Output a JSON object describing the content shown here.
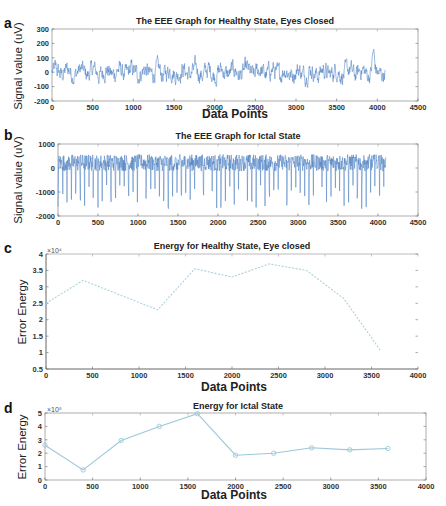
{
  "chart_data": [
    {
      "panel_label": "a",
      "type": "line",
      "title": "The EEE Graph for Healthy State, Eyes Closed",
      "xlabel": "Data Points",
      "ylabel": "Signal value (uV)",
      "xlim": [
        0,
        4500
      ],
      "ylim": [
        -200,
        300
      ],
      "xticks": [
        0,
        500,
        1000,
        1500,
        2000,
        2500,
        3000,
        3500,
        4000,
        4500
      ],
      "yticks": [
        -200,
        -100,
        0,
        100,
        200,
        300
      ],
      "series": [
        {
          "name": "EEG healthy eyes closed",
          "n_points": 4097,
          "approx_range": [
            -160,
            230
          ],
          "notable_peak": {
            "x": 3950,
            "y": 225
          },
          "color": "#4a7fc1"
        }
      ],
      "grid": false
    },
    {
      "panel_label": "b",
      "type": "line",
      "title": "The EEE Graph for Ictal State",
      "xlabel": "Data Points",
      "ylabel": "Signal value (uV)",
      "xlim": [
        0,
        4500
      ],
      "ylim": [
        -2000,
        1000
      ],
      "xticks": [
        0,
        500,
        1000,
        1500,
        2000,
        2500,
        3000,
        3500,
        4000,
        4500
      ],
      "yticks": [
        -2000,
        -1000,
        0,
        1000
      ],
      "series": [
        {
          "name": "EEG ictal",
          "n_points": 4097,
          "approx_range": [
            -1800,
            900
          ],
          "color": "#4a7fc1"
        }
      ],
      "grid": false
    },
    {
      "panel_label": "c",
      "type": "line",
      "title": "Energy for Healthy State, Eye closed",
      "xlabel": "Data Points",
      "ylabel": "Error Energy",
      "y_multiplier": "×10^4",
      "xlim": [
        0,
        4000
      ],
      "ylim": [
        0.5,
        4
      ],
      "xticks": [
        0,
        500,
        1000,
        1500,
        2000,
        2500,
        3000,
        3500,
        4000
      ],
      "yticks": [
        0.5,
        1,
        1.5,
        2,
        2.5,
        3,
        3.5,
        4
      ],
      "series": [
        {
          "name": "Energy healthy",
          "x": [
            0,
            400,
            1200,
            1600,
            2000,
            2400,
            2800,
            3200,
            3600
          ],
          "y": [
            2.5,
            3.2,
            2.3,
            3.55,
            3.3,
            3.7,
            3.5,
            2.65,
            1.05
          ],
          "color": "#a8d4dc"
        }
      ],
      "grid": false
    },
    {
      "panel_label": "d",
      "type": "line",
      "title": "Energy for Ictal State",
      "xlabel": "Data Points",
      "ylabel": "Error Energy",
      "y_multiplier": "×10^8",
      "xlim": [
        0,
        4000
      ],
      "ylim": [
        0,
        5
      ],
      "xticks": [
        0,
        500,
        1000,
        1500,
        2000,
        2500,
        3000,
        3500,
        4000
      ],
      "yticks": [
        0,
        1,
        2,
        3,
        4,
        5
      ],
      "series": [
        {
          "name": "Energy ictal",
          "x": [
            0,
            400,
            800,
            1200,
            1600,
            2000,
            2400,
            2800,
            3200,
            3600
          ],
          "y": [
            2.6,
            0.75,
            2.95,
            4.0,
            4.95,
            1.85,
            2.0,
            2.4,
            2.25,
            2.35
          ],
          "marker": "circle",
          "color": "#9cc8d8"
        }
      ],
      "grid": false
    }
  ],
  "labels": {
    "a": {
      "panel": "a",
      "title": "The EEE Graph for Healthy State, Eyes Closed",
      "xlabel": "Data Points",
      "ylabel": "Signal value (uV)"
    },
    "b": {
      "panel": "b",
      "title": "The EEE Graph for Ictal State",
      "xlabel": "Data Points",
      "ylabel": "Signal value (uV)"
    },
    "c": {
      "panel": "c",
      "title": "Energy for Healthy State, Eye closed",
      "xlabel": "Data Points",
      "ylabel": "Error Energy",
      "exp": "×10⁴"
    },
    "d": {
      "panel": "d",
      "title": "Energy for Ictal State",
      "xlabel": "Data Points",
      "ylabel": "Error Energy",
      "exp": "×10⁸"
    }
  }
}
